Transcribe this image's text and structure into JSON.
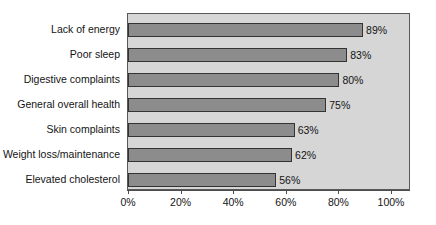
{
  "chart_data": {
    "type": "bar",
    "orientation": "horizontal",
    "title": "",
    "subtitle": "",
    "xlabel": "",
    "ylabel": "",
    "categories": [
      "Lack of energy",
      "Poor sleep",
      "Digestive complaints",
      "General overall health",
      "Skin complaints",
      "Weight loss/maintenance",
      "Elevated cholesterol"
    ],
    "values": [
      89,
      83,
      80,
      75,
      63,
      62,
      56
    ],
    "value_labels": [
      "89%",
      "83%",
      "80%",
      "75%",
      "63%",
      "62%",
      "56%"
    ],
    "xlim": [
      0,
      100
    ],
    "xticks": [
      0,
      20,
      40,
      60,
      80,
      100
    ],
    "xtick_labels": [
      "0%",
      "20%",
      "40%",
      "60%",
      "80%",
      "100%"
    ],
    "grid": false,
    "legend": false,
    "legend_position": "none",
    "bar_color": "#8c8c8c",
    "bar_border_color": "#333333",
    "plot_background": "#d6d6d6",
    "panel_border_color": "#595959",
    "figure_background": "#ffffff",
    "text_color": "#141414"
  }
}
